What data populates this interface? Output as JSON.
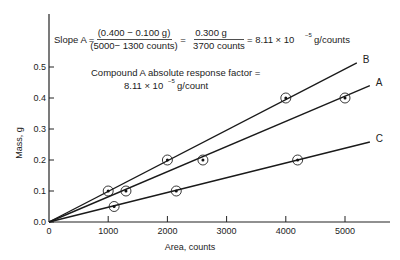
{
  "chart_data": {
    "type": "line",
    "title": "",
    "xlabel": "Area, counts",
    "ylabel": "Mass, g",
    "xlim": [
      0,
      5800
    ],
    "ylim": [
      0,
      0.58
    ],
    "grid": false,
    "x_ticks": [
      "0",
      "1000",
      "2000",
      "3000",
      "4000",
      "5000"
    ],
    "y_ticks": [
      "0.0",
      "0.1",
      "0.2",
      "0.3",
      "0.4",
      "0.5"
    ],
    "series": [
      {
        "name": "B",
        "points": [
          [
            1000,
            0.1
          ],
          [
            2000,
            0.2
          ],
          [
            4000,
            0.4
          ]
        ],
        "line_end": [
          5200,
          0.513
        ]
      },
      {
        "name": "A",
        "points": [
          [
            1300,
            0.1
          ],
          [
            2600,
            0.2
          ],
          [
            5000,
            0.4
          ]
        ],
        "line_end": [
          5420,
          0.44
        ]
      },
      {
        "name": "C",
        "points": [
          [
            1100,
            0.05
          ],
          [
            2150,
            0.1
          ],
          [
            4200,
            0.2
          ]
        ],
        "line_end": [
          5420,
          0.258
        ]
      }
    ],
    "annotations": {
      "slope_prefix": "Slope A =",
      "slope_num1": "(0.400 − 0.100 g)",
      "slope_den1": "(5000− 1300 counts)",
      "equals1": "=",
      "slope_num2": "0.300 g",
      "slope_den2": "3700 counts",
      "slope_result": "= 8.11 × 10",
      "slope_exp": "−5",
      "slope_unit": "g/counts",
      "rf_line1": "Compound A absolute response factor  =",
      "rf_value": "8.11 × 10",
      "rf_exp": "−5",
      "rf_unit": "g/count"
    }
  }
}
